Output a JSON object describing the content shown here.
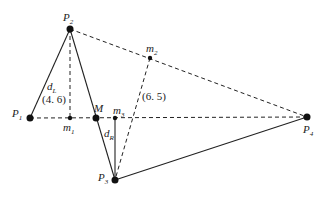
{
  "diagram": {
    "points": {
      "P1": {
        "label": "P",
        "sub": "1",
        "x": 30,
        "y": 118
      },
      "P2": {
        "label": "P",
        "sub": "2",
        "x": 70,
        "y": 29
      },
      "P3": {
        "label": "P",
        "sub": "3",
        "x": 115,
        "y": 180
      },
      "P4": {
        "label": "P",
        "sub": "4",
        "x": 307,
        "y": 117
      },
      "M": {
        "label": "M",
        "x": 96,
        "y": 118
      },
      "m1": {
        "label": "m",
        "sub": "1",
        "x": 70,
        "y": 118
      },
      "m2": {
        "label": "m",
        "sub": "2",
        "x": 150,
        "y": 58
      },
      "m3": {
        "label": "m",
        "sub": "3",
        "x": 115,
        "y": 118
      }
    },
    "labels": {
      "dL": {
        "main": "d",
        "sub": "L"
      },
      "dR": {
        "main": "d",
        "sub": "R"
      },
      "val_left": "(4. 6)",
      "val_right": "(6. 5)"
    }
  }
}
